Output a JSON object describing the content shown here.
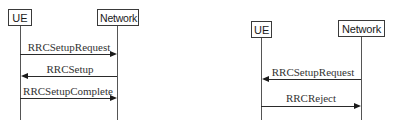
{
  "diagrams": [
    {
      "name": "rrc-setup-successful",
      "entities": {
        "ue": "UE",
        "network": "Network"
      },
      "messages": [
        {
          "label": "RRCSetupRequest",
          "direction": "UE to Network"
        },
        {
          "label": "RRCSetup",
          "direction": "Network to UE"
        },
        {
          "label": "RRCSetupComplete",
          "direction": "UE to Network"
        }
      ]
    },
    {
      "name": "rrc-setup-rejected",
      "entities": {
        "ue": "UE",
        "network": "Network"
      },
      "messages": [
        {
          "label": "RRCSetupRequest",
          "direction": "Network to UE"
        },
        {
          "label": "RRCReject",
          "direction": "UE to Network"
        }
      ]
    }
  ],
  "colors": {
    "line": "#2a2a2a",
    "lifeline": "#555555",
    "box_border": "#3a3a3a",
    "text": "#333333"
  }
}
